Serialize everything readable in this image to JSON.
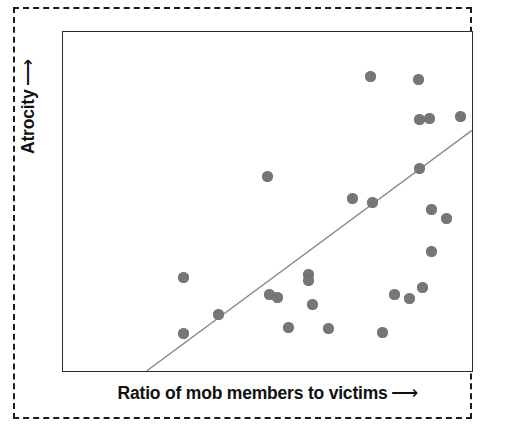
{
  "figure": {
    "border_style": "dashed",
    "background_color": "#ffffff"
  },
  "axes": {
    "x_label": "Ratio of mob members to victims",
    "x_arrow": "⟶",
    "y_label": "Atrocity",
    "y_arrow": "⟶",
    "frame_color": "#2a2a2a"
  },
  "credit": {
    "text": ""
  },
  "chart_data": {
    "type": "scatter",
    "title": "",
    "subtitle": "",
    "xlabel": "Ratio of mob members to victims",
    "ylabel": "Atrocity",
    "xlim": [
      0,
      100
    ],
    "ylim": [
      0,
      100
    ],
    "grid": false,
    "legend": null,
    "axis_ticks": {
      "x": [],
      "y": []
    },
    "marker": {
      "shape": "circle",
      "color": "#767676",
      "size_px": 11
    },
    "series": [
      {
        "name": "Lynching incidents",
        "n_points": 26,
        "points": [
          {
            "x": 29.2,
            "y": 28.1
          },
          {
            "x": 29.2,
            "y": 11.7
          },
          {
            "x": 37.7,
            "y": 17.3
          },
          {
            "x": 49.6,
            "y": 57.8
          },
          {
            "x": 50.1,
            "y": 23.2
          },
          {
            "x": 52.1,
            "y": 22.3
          },
          {
            "x": 54.7,
            "y": 13.5
          },
          {
            "x": 59.6,
            "y": 29.0
          },
          {
            "x": 59.6,
            "y": 27.3
          },
          {
            "x": 60.6,
            "y": 20.2
          },
          {
            "x": 64.5,
            "y": 13.2
          },
          {
            "x": 70.3,
            "y": 49.6
          },
          {
            "x": 74.7,
            "y": 87.1
          },
          {
            "x": 75.2,
            "y": 48.4
          },
          {
            "x": 77.6,
            "y": 10.3
          },
          {
            "x": 80.5,
            "y": 22.3
          },
          {
            "x": 84.2,
            "y": 21.1
          },
          {
            "x": 86.4,
            "y": 86.2
          },
          {
            "x": 86.6,
            "y": 74.5
          },
          {
            "x": 86.6,
            "y": 60.1
          },
          {
            "x": 87.3,
            "y": 25.2
          },
          {
            "x": 89.1,
            "y": 74.8
          },
          {
            "x": 89.5,
            "y": 46.1
          },
          {
            "x": 89.5,
            "y": 33.7
          },
          {
            "x": 96.6,
            "y": 75.4
          },
          {
            "x": 93.2,
            "y": 44.1
          }
        ]
      }
    ],
    "trendline": {
      "type": "linear",
      "color": "#8a8a8a",
      "x_start": 20.4,
      "y_start": 0.0,
      "x_end": 100.0,
      "y_end": 71.0
    },
    "annotation": "Positive association: atrocity increases with the ratio of mob members to victims."
  },
  "points_px": [
    {
      "cx": 120,
      "cy": 245
    },
    {
      "cx": 120,
      "cy": 301
    },
    {
      "cx": 155,
      "cy": 282
    },
    {
      "cx": 204,
      "cy": 144
    },
    {
      "cx": 206,
      "cy": 262
    },
    {
      "cx": 214,
      "cy": 265
    },
    {
      "cx": 225,
      "cy": 295
    },
    {
      "cx": 245,
      "cy": 242
    },
    {
      "cx": 245,
      "cy": 248
    },
    {
      "cx": 249,
      "cy": 272
    },
    {
      "cx": 265,
      "cy": 296
    },
    {
      "cx": 289,
      "cy": 166
    },
    {
      "cx": 307,
      "cy": 44
    },
    {
      "cx": 309,
      "cy": 170
    },
    {
      "cx": 319,
      "cy": 300
    },
    {
      "cx": 331,
      "cy": 262
    },
    {
      "cx": 346,
      "cy": 266
    },
    {
      "cx": 355,
      "cy": 47
    },
    {
      "cx": 356,
      "cy": 87
    },
    {
      "cx": 356,
      "cy": 136
    },
    {
      "cx": 359,
      "cy": 255
    },
    {
      "cx": 366,
      "cy": 86
    },
    {
      "cx": 368,
      "cy": 177
    },
    {
      "cx": 368,
      "cy": 219
    },
    {
      "cx": 397,
      "cy": 84
    },
    {
      "cx": 383,
      "cy": 186
    }
  ],
  "trendline_px": {
    "x1": 84,
    "y1": 341,
    "x2": 411,
    "y2": 99
  }
}
